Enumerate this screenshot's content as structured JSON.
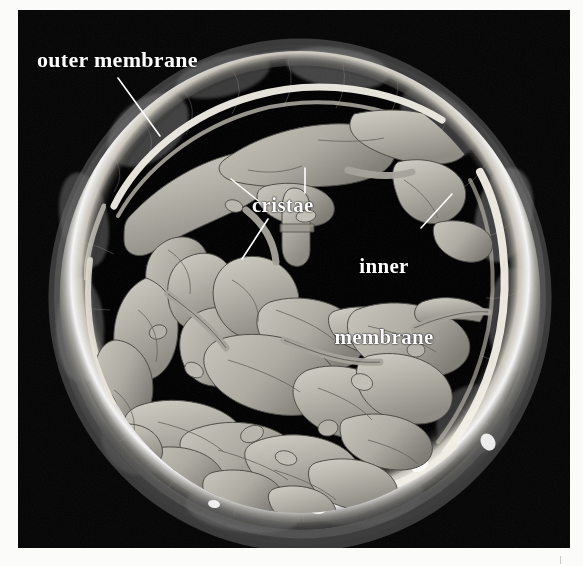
{
  "figure": {
    "type": "electron-tomography-micrograph",
    "background_color": "#fbfbfa",
    "panel_color": "#050505"
  },
  "annotations": {
    "outer_membrane": {
      "label": "outer membrane",
      "color": "#ffffff",
      "leader": {
        "x1": 118,
        "y1": 78,
        "x2": 160,
        "y2": 136
      }
    },
    "cristae": {
      "label": "cristae",
      "color": "#ffffff",
      "leaders": [
        {
          "x1": 266,
          "y1": 207,
          "x2": 231,
          "y2": 179
        },
        {
          "x1": 305,
          "y1": 193,
          "x2": 305,
          "y2": 168
        },
        {
          "x1": 268,
          "y1": 219,
          "x2": 242,
          "y2": 259
        }
      ]
    },
    "inner_membrane": {
      "label_line1": "inner",
      "label_line2": "membrane",
      "color": "#ffffff",
      "leader": {
        "x1": 421,
        "y1": 228,
        "x2": 452,
        "y2": 194
      }
    }
  },
  "structure": {
    "outer_membrane_color": "#6c6c6c",
    "inner_membrane_color": "#f2f0ea",
    "cristae_color": "#b8b6ac",
    "matrix_color": "#050505",
    "center": {
      "cx": 300,
      "cy": 293
    },
    "outer_radius": 232,
    "inner_radius": 206
  },
  "bottom_tick": {
    "present": true,
    "color": "#c9c9c7"
  }
}
